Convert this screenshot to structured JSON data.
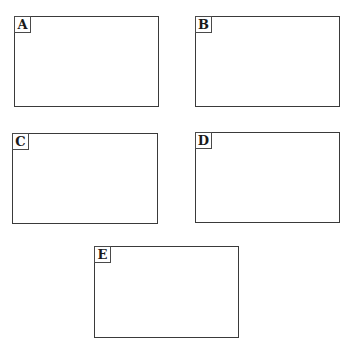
{
  "panels": [
    {
      "id": "A",
      "label": "A",
      "x": 14,
      "y": 16,
      "w": 145,
      "h": 91
    },
    {
      "id": "B",
      "label": "B",
      "x": 195,
      "y": 16,
      "w": 145,
      "h": 91
    },
    {
      "id": "C",
      "label": "C",
      "x": 12,
      "y": 133,
      "w": 146,
      "h": 91
    },
    {
      "id": "D",
      "label": "D",
      "x": 195,
      "y": 132,
      "w": 145,
      "h": 91
    },
    {
      "id": "E",
      "label": "E",
      "x": 94,
      "y": 246,
      "w": 145,
      "h": 92
    }
  ]
}
